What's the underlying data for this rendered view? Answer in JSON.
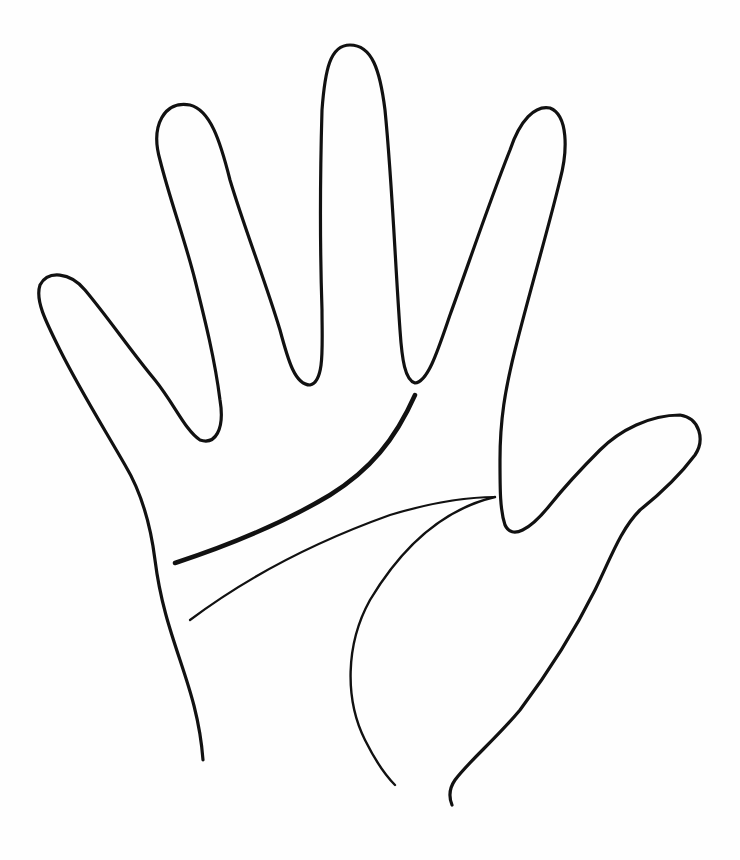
{
  "diagram": {
    "elements": [
      "hand-outline",
      "heart-line",
      "head-line",
      "life-line"
    ],
    "colors": {
      "line": "#111111",
      "background": "#fefefe"
    }
  }
}
